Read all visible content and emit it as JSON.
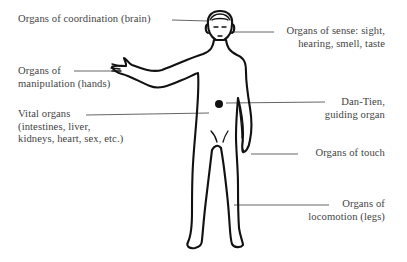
{
  "diagram": {
    "labels": {
      "coordination": {
        "lines": [
          "Organs of coordination (brain)"
        ]
      },
      "sense": {
        "lines": [
          "Organs of sense: sight,",
          "hearing, smell, taste"
        ]
      },
      "manipulation": {
        "lines": [
          "Organs of",
          "manipulation (hands)"
        ]
      },
      "vital": {
        "lines": [
          "Vital organs",
          "(intestines, liver,",
          "kidneys, heart, sex, etc.)"
        ]
      },
      "dantien": {
        "lines": [
          "Dan-Tien,",
          "guiding organ"
        ]
      },
      "touch": {
        "lines": [
          "Organs of touch"
        ]
      },
      "locomotion": {
        "lines": [
          "Organs of",
          "locomotion (legs)"
        ]
      }
    },
    "colors": {
      "text": "#3f3f3f",
      "outline": "#111111",
      "leader": "#555555",
      "background": "#ffffff"
    }
  }
}
